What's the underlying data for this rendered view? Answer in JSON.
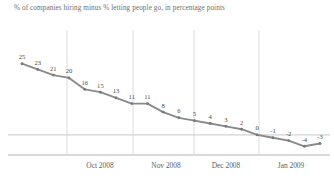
{
  "chart_data": {
    "type": "line",
    "title": "% of companies hiring minus % letting people go, in percentage points",
    "xlabel": "",
    "ylabel": "",
    "x_tick_labels": [
      "Oct 2008",
      "Nov 2008",
      "Dec 2008",
      "Jan 2009"
    ],
    "categories": [
      "1",
      "2",
      "3",
      "4",
      "5",
      "6",
      "7",
      "8",
      "9",
      "10",
      "11",
      "12",
      "13",
      "14",
      "15",
      "16",
      "17",
      "18",
      "19",
      "20"
    ],
    "values": [
      25,
      23,
      21,
      20,
      16,
      15,
      13,
      11,
      11,
      8,
      6,
      5,
      4,
      3,
      2,
      0,
      -1,
      -2,
      -4,
      -3
    ],
    "point_labels": [
      "25",
      "23",
      "21",
      "20",
      "16",
      "15",
      "13",
      "11",
      "11",
      "8",
      "6",
      "5",
      "4",
      "3",
      "2",
      "0",
      "-1",
      "-2",
      "-4",
      "-3"
    ],
    "ylim": [
      -6,
      27
    ],
    "grid": "vertical-month-separators",
    "zero_line": 0,
    "legend": "none",
    "series": [
      {
        "name": "net hiring intention",
        "values": [
          25,
          23,
          21,
          20,
          16,
          15,
          13,
          11,
          11,
          8,
          6,
          5,
          4,
          3,
          2,
          0,
          -1,
          -2,
          -4,
          -3
        ]
      }
    ],
    "colors": {
      "line": "#8a8a8a",
      "marker": "#7a7a7a",
      "gridline": "#dcdcdc",
      "zero_line": "#c8c8c8",
      "axis": "#b4b4b4",
      "title_text": "#6e6e6e",
      "label_text": "#4a4a4a",
      "tick_text": "#5d5d5d"
    }
  }
}
